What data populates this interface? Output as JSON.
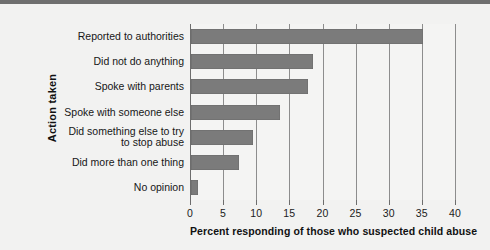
{
  "chart_data": {
    "type": "bar",
    "orientation": "horizontal",
    "title": "",
    "xlabel": "Percent responding of those who suspected child abuse",
    "ylabel": "Action taken",
    "xlim": [
      0,
      40
    ],
    "xticks": [
      0,
      5,
      10,
      15,
      20,
      25,
      30,
      35,
      40
    ],
    "xtick_labels": [
      "0",
      "5",
      "10",
      "15",
      "20",
      "25",
      "30",
      "35",
      "40"
    ],
    "grid": true,
    "grid_axis": "x",
    "legend": null,
    "categories": [
      "Reported to authorities",
      "Did not do anything",
      "Spoke with parents",
      "Spoke with someone else",
      "Did something else to try\nto stop abuse",
      "Did more than one thing",
      "No opinion"
    ],
    "values": [
      35,
      18.4,
      17.7,
      13.4,
      9.3,
      7.2,
      1.1
    ],
    "bar_color": "#7b7b7b",
    "background_color": "#f2f2f1",
    "axis_color": "#6d6d6d"
  },
  "chart": {
    "xlabel": "Percent responding of those who suspected child abuse",
    "ylabel": "Action taken"
  }
}
